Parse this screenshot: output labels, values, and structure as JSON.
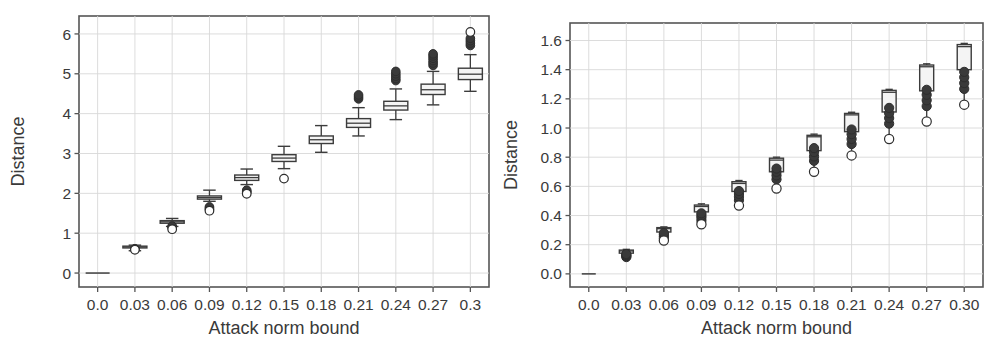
{
  "figure": {
    "panel_count": 2,
    "background_color": "#ffffff",
    "grid_color": "#d8d8d8",
    "frame_color": "#555555",
    "box_fill_color": "#f4f4f4",
    "box_edge_color": "#3c3c3c",
    "outlier_color": "#2e2e2e"
  },
  "chart_data": [
    {
      "type": "box",
      "panel": "left",
      "title": "",
      "xlabel": "Attack norm bound",
      "ylabel": "Distance",
      "grid": true,
      "legend": "none",
      "xtick_labels": [
        "0.0",
        "0.03",
        "0.06",
        "0.09",
        "0.12",
        "0.15",
        "0.18",
        "0.21",
        "0.24",
        "0.27",
        "0.3"
      ],
      "ytick_labels": [
        "0",
        "1",
        "2",
        "3",
        "4",
        "5",
        "6"
      ],
      "ytick_values": [
        0,
        1,
        2,
        3,
        4,
        5,
        6
      ],
      "ylim": [
        -0.35,
        6.45
      ],
      "categories": [
        0.0,
        0.03,
        0.06,
        0.09,
        0.12,
        0.15,
        0.18,
        0.21,
        0.24,
        0.27,
        0.3
      ],
      "boxes": [
        {
          "x": "0.0",
          "min": 0.0,
          "q1": 0.0,
          "median": 0.0,
          "q3": 0.0,
          "max": 0.0,
          "outliers": [],
          "dense_outliers": []
        },
        {
          "x": "0.03",
          "min": 0.56,
          "q1": 0.63,
          "median": 0.655,
          "q3": 0.675,
          "max": 0.7,
          "outliers": [
            0.585
          ],
          "dense_outliers": [
            0.6,
            0.61
          ]
        },
        {
          "x": "0.06",
          "min": 1.17,
          "q1": 1.25,
          "median": 1.285,
          "q3": 1.315,
          "max": 1.37,
          "outliers": [
            1.1
          ],
          "dense_outliers": [
            1.14,
            1.16,
            1.18
          ]
        },
        {
          "x": "0.09",
          "min": 1.8,
          "q1": 1.855,
          "median": 1.895,
          "q3": 1.935,
          "max": 2.08,
          "outliers": [
            1.565
          ],
          "dense_outliers": [
            1.6,
            1.63,
            1.66
          ]
        },
        {
          "x": "0.12",
          "min": 2.22,
          "q1": 2.325,
          "median": 2.395,
          "q3": 2.46,
          "max": 2.61,
          "outliers": [
            1.99
          ],
          "dense_outliers": [
            2.02,
            2.05,
            2.08
          ]
        },
        {
          "x": "0.15",
          "min": 2.62,
          "q1": 2.8,
          "median": 2.885,
          "q3": 2.97,
          "max": 3.18,
          "outliers": [
            2.37
          ],
          "dense_outliers": []
        },
        {
          "x": "0.18",
          "min": 3.03,
          "q1": 3.25,
          "median": 3.345,
          "q3": 3.44,
          "max": 3.7,
          "outliers": [],
          "dense_outliers": []
        },
        {
          "x": "0.21",
          "min": 3.44,
          "q1": 3.655,
          "median": 3.76,
          "q3": 3.875,
          "max": 4.15,
          "outliers": [],
          "dense_outliers": [
            4.37,
            4.42,
            4.47
          ]
        },
        {
          "x": "0.24",
          "min": 3.85,
          "q1": 4.09,
          "median": 4.195,
          "q3": 4.31,
          "max": 4.62,
          "outliers": [],
          "dense_outliers": [
            4.83,
            4.88,
            4.94,
            5.0,
            5.06
          ]
        },
        {
          "x": "0.27",
          "min": 4.22,
          "q1": 4.48,
          "median": 4.6,
          "q3": 4.74,
          "max": 5.06,
          "outliers": [],
          "dense_outliers": [
            5.21,
            5.27,
            5.33,
            5.39,
            5.45,
            5.5
          ]
        },
        {
          "x": "0.3",
          "min": 4.56,
          "q1": 4.855,
          "median": 4.99,
          "q3": 5.14,
          "max": 5.48,
          "outliers": [
            6.05
          ],
          "dense_outliers": [
            5.71,
            5.77,
            5.83,
            5.89
          ]
        }
      ]
    },
    {
      "type": "box",
      "panel": "right",
      "title": "",
      "xlabel": "Attack norm bound",
      "ylabel": "Distance",
      "grid": true,
      "legend": "none",
      "xtick_labels": [
        "0.0",
        "0.03",
        "0.06",
        "0.09",
        "0.12",
        "0.15",
        "0.18",
        "0.21",
        "0.24",
        "0.27",
        "0.30"
      ],
      "ytick_labels": [
        "0.0",
        "0.2",
        "0.4",
        "0.6",
        "0.8",
        "1.0",
        "1.2",
        "1.4",
        "1.6"
      ],
      "ytick_values": [
        0.0,
        0.2,
        0.4,
        0.6,
        0.8,
        1.0,
        1.2,
        1.4,
        1.6
      ],
      "ylim": [
        -0.09,
        1.72
      ],
      "categories": [
        0.0,
        0.03,
        0.06,
        0.09,
        0.12,
        0.15,
        0.18,
        0.21,
        0.24,
        0.27,
        0.3
      ],
      "boxes": [
        {
          "x": "0.0",
          "min": 0.0,
          "q1": 0.0,
          "median": 0.0,
          "q3": 0.0,
          "max": 0.0,
          "outliers": [],
          "dense_outliers": []
        },
        {
          "x": "0.03",
          "min": 0.112,
          "q1": 0.142,
          "median": 0.157,
          "q3": 0.163,
          "max": 0.168,
          "outliers": [],
          "dense_outliers": [
            0.115,
            0.122,
            0.129,
            0.136
          ]
        },
        {
          "x": "0.06",
          "min": 0.225,
          "q1": 0.287,
          "median": 0.31,
          "q3": 0.317,
          "max": 0.322,
          "outliers": [
            0.228
          ],
          "dense_outliers": [
            0.243,
            0.255,
            0.268,
            0.28
          ]
        },
        {
          "x": "0.09",
          "min": 0.335,
          "q1": 0.425,
          "median": 0.462,
          "q3": 0.472,
          "max": 0.48,
          "outliers": [
            0.34
          ],
          "dense_outliers": [
            0.365,
            0.385,
            0.4,
            0.415
          ]
        },
        {
          "x": "0.12",
          "min": 0.465,
          "q1": 0.565,
          "median": 0.62,
          "q3": 0.632,
          "max": 0.64,
          "outliers": [
            0.468
          ],
          "dense_outliers": [
            0.505,
            0.528,
            0.548,
            0.568
          ]
        },
        {
          "x": "0.15",
          "min": 0.585,
          "q1": 0.7,
          "median": 0.78,
          "q3": 0.793,
          "max": 0.8,
          "outliers": [
            0.585
          ],
          "dense_outliers": [
            0.648,
            0.675,
            0.7,
            0.722
          ]
        },
        {
          "x": "0.18",
          "min": 0.7,
          "q1": 0.845,
          "median": 0.94,
          "q3": 0.95,
          "max": 0.958,
          "outliers": [
            0.7
          ],
          "dense_outliers": [
            0.775,
            0.805,
            0.835,
            0.862
          ]
        },
        {
          "x": "0.21",
          "min": 0.812,
          "q1": 0.975,
          "median": 1.09,
          "q3": 1.1,
          "max": 1.108,
          "outliers": [
            0.812
          ],
          "dense_outliers": [
            0.89,
            0.925,
            0.958,
            0.99
          ]
        },
        {
          "x": "0.24",
          "min": 0.925,
          "q1": 1.11,
          "median": 1.245,
          "q3": 1.258,
          "max": 1.265,
          "outliers": [
            0.925
          ],
          "dense_outliers": [
            1.03,
            1.068,
            1.102,
            1.138
          ]
        },
        {
          "x": "0.27",
          "min": 1.045,
          "q1": 1.255,
          "median": 1.42,
          "q3": 1.432,
          "max": 1.44,
          "outliers": [
            1.045
          ],
          "dense_outliers": [
            1.15,
            1.19,
            1.228,
            1.262
          ]
        },
        {
          "x": "0.30",
          "min": 1.16,
          "q1": 1.4,
          "median": 1.558,
          "q3": 1.572,
          "max": 1.58,
          "outliers": [
            1.16
          ],
          "dense_outliers": [
            1.268,
            1.308,
            1.348,
            1.385
          ]
        }
      ]
    }
  ]
}
